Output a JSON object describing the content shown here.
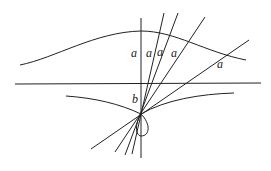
{
  "diagram": {
    "labels": {
      "a1": "a",
      "a2": "a",
      "a3": "a",
      "a4": "a",
      "a5": "a",
      "b": "b"
    },
    "colors": {
      "stroke": "#222222",
      "background": "#ffffff"
    }
  }
}
